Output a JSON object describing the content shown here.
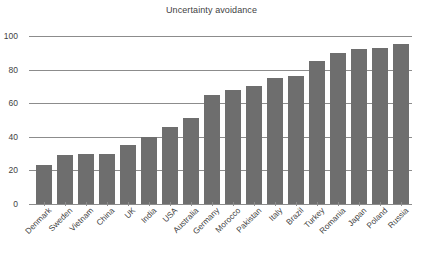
{
  "chart_data": {
    "type": "bar",
    "title": "Uncertainty avoidance",
    "xlabel": "",
    "ylabel": "",
    "ylim": [
      0,
      100
    ],
    "yticks": [
      0,
      20,
      40,
      60,
      80,
      100
    ],
    "grid": true,
    "legend": false,
    "legend_position": "none",
    "bar_color": "#6e6e6e",
    "gridline_color": "#8c8c8c",
    "text_color": "#3f3f3f",
    "background_color": "#ffffff",
    "categories": [
      "Denmark",
      "Sweden",
      "Vietnam",
      "China",
      "UK",
      "India",
      "USA",
      "Australia",
      "Germany",
      "Morocco",
      "Pakistan",
      "Italy",
      "Brazil",
      "Turkey",
      "Romania",
      "Japan",
      "Poland",
      "Russia"
    ],
    "values": [
      23,
      29,
      30,
      30,
      35,
      40,
      46,
      51,
      65,
      68,
      70,
      75,
      76,
      85,
      90,
      92,
      93,
      95
    ]
  }
}
